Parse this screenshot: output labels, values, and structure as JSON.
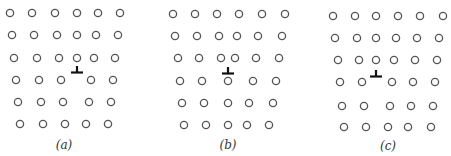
{
  "figure": {
    "atom_radius": 3.6,
    "colors": {
      "atom_stroke": "#555555",
      "dislocation": "#111111",
      "label": "#333333"
    },
    "panels": [
      {
        "id": "a",
        "label": "(a)",
        "label_pos": [
          64,
          138
        ],
        "dislocation": [
          77,
          71
        ],
        "rows": [
          {
            "y": 13,
            "x": [
              10,
              32,
              55,
              77,
              98,
              120
            ]
          },
          {
            "y": 35,
            "x": [
              12,
              34,
              57,
              77,
              96,
              118
            ]
          },
          {
            "y": 58,
            "x": [
              14,
              37,
              59,
              77,
              94,
              115
            ]
          },
          {
            "y": 80,
            "x": [
              16,
              39,
              61,
              91,
              113
            ]
          },
          {
            "y": 102,
            "x": [
              18,
              41,
              63,
              89,
              111
            ]
          },
          {
            "y": 124,
            "x": [
              20,
              43,
              65,
              86,
              108
            ]
          }
        ]
      },
      {
        "id": "b",
        "label": "(b)",
        "label_pos": [
          228,
          138
        ],
        "dislocation": [
          228,
          72
        ],
        "rows": [
          {
            "y": 14,
            "x": [
              173,
              195,
              217,
              239,
              262,
              285
            ]
          },
          {
            "y": 36,
            "x": [
              175,
              197,
              219,
              237,
              258,
              282
            ]
          },
          {
            "y": 58,
            "x": [
              178,
              199,
              221,
              235,
              256,
              279
            ]
          },
          {
            "y": 81,
            "x": [
              180,
              202,
              228,
              253,
              276
            ]
          },
          {
            "y": 103,
            "x": [
              182,
              204,
              228,
              249,
              273
            ]
          },
          {
            "y": 125,
            "x": [
              184,
              206,
              228,
              247,
              269
            ]
          }
        ]
      },
      {
        "id": "c",
        "label": "(c)",
        "label_pos": [
          388,
          139
        ],
        "dislocation": [
          376,
          75
        ],
        "rows": [
          {
            "y": 16,
            "x": [
              333,
              355,
              376,
              398,
              420,
              443
            ]
          },
          {
            "y": 38,
            "x": [
              335,
              357,
              376,
              396,
              417,
              439
            ]
          },
          {
            "y": 60,
            "x": [
              338,
              359,
              376,
              394,
              415,
              437
            ]
          },
          {
            "y": 82,
            "x": [
              340,
              362,
              392,
              413,
              435
            ]
          },
          {
            "y": 106,
            "x": [
              342,
              364,
              390,
              411,
              433
            ]
          },
          {
            "y": 127,
            "x": [
              344,
              366,
              388,
              408,
              431
            ]
          }
        ]
      }
    ]
  }
}
